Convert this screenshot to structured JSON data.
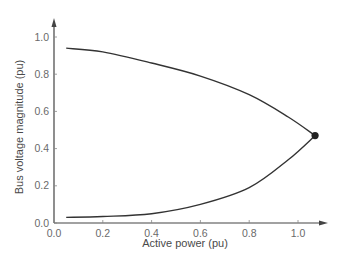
{
  "chart_data": {
    "type": "line",
    "title": "",
    "xlabel": "Active power (pu)",
    "ylabel": "Bus voltage magnitude (pu)",
    "xlim": [
      0.0,
      1.1
    ],
    "ylim": [
      0.0,
      1.05
    ],
    "x_ticks": [
      "0.0",
      "0.2",
      "0.4",
      "0.6",
      "0.8",
      "1.0"
    ],
    "y_ticks": [
      "0.0",
      "0.2",
      "0.4",
      "0.6",
      "0.8",
      "1.0"
    ],
    "grid": false,
    "legend": null,
    "series": [
      {
        "name": "Upper branch (stable)",
        "x": [
          0.05,
          0.2,
          0.4,
          0.6,
          0.8,
          0.96,
          1.07
        ],
        "y": [
          0.94,
          0.92,
          0.86,
          0.79,
          0.69,
          0.57,
          0.47
        ]
      },
      {
        "name": "Lower branch (unstable)",
        "x": [
          0.05,
          0.2,
          0.4,
          0.6,
          0.8,
          0.96,
          1.07
        ],
        "y": [
          0.03,
          0.035,
          0.05,
          0.1,
          0.19,
          0.34,
          0.47
        ]
      }
    ],
    "annotations": [
      {
        "type": "point",
        "label": "nose point (maximum loadability)",
        "x": 1.07,
        "y": 0.47
      }
    ]
  },
  "axes": {
    "x_title": "Active power (pu)",
    "y_title": "Bus voltage magnitude (pu)",
    "x_tick_labels": [
      "0.0",
      "0.2",
      "0.4",
      "0.6",
      "0.8",
      "1.0"
    ],
    "y_tick_labels": [
      "0.0",
      "0.2",
      "0.4",
      "0.6",
      "0.8",
      "1.0"
    ]
  },
  "colors": {
    "curve": "#333333",
    "axis": "#444444",
    "text": "#6a6a6a",
    "marker": "#222222"
  }
}
